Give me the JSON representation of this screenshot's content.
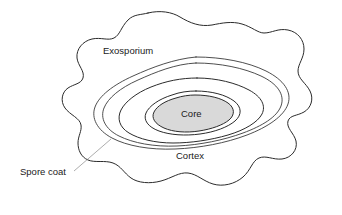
{
  "figure": {
    "background_color": "#ffffff",
    "line_color": "#2b2b2b",
    "core_fill_color": "#d9d9d9",
    "leader_color": "#8a8a8a"
  },
  "labels": {
    "exosporium": "Exosporium",
    "spore_coat": "Spore coat",
    "cortex": "Cortex",
    "core": "Core"
  },
  "structures": [
    {
      "name": "exosporium",
      "label": "Exosporium",
      "description": "outermost wavy lobed envelope",
      "line_count": 1,
      "filled": false
    },
    {
      "name": "spore-coat",
      "label": "Spore coat",
      "description": "double concentric line layer inside exosporium",
      "line_count": 2,
      "filled": false
    },
    {
      "name": "cortex",
      "label": "Cortex",
      "description": "single line layer between spore coat and core",
      "line_count": 1,
      "filled": false
    },
    {
      "name": "core",
      "label": "Core",
      "description": "innermost shaded ellipse",
      "line_count": 2,
      "filled": true,
      "fill": "#d9d9d9"
    }
  ]
}
